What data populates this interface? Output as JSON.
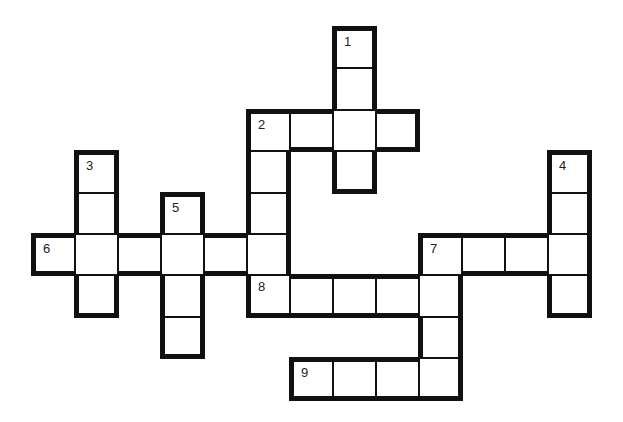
{
  "puzzle": {
    "type": "crossword",
    "grid": {
      "origin_x": 31,
      "origin_y": 26,
      "cell_w": 43,
      "cell_h": 41.4
    },
    "cells": [
      {
        "c": 7,
        "r": 0,
        "num": "1"
      },
      {
        "c": 7,
        "r": 1
      },
      {
        "c": 5,
        "r": 2,
        "num": "2"
      },
      {
        "c": 6,
        "r": 2
      },
      {
        "c": 7,
        "r": 2
      },
      {
        "c": 8,
        "r": 2
      },
      {
        "c": 7,
        "r": 3
      },
      {
        "c": 5,
        "r": 3
      },
      {
        "c": 5,
        "r": 4
      },
      {
        "c": 1,
        "r": 3,
        "num": "3"
      },
      {
        "c": 1,
        "r": 4
      },
      {
        "c": 1,
        "r": 6
      },
      {
        "c": 12,
        "r": 3,
        "num": "4"
      },
      {
        "c": 12,
        "r": 4
      },
      {
        "c": 12,
        "r": 6
      },
      {
        "c": 3,
        "r": 4,
        "num": "5"
      },
      {
        "c": 3,
        "r": 6
      },
      {
        "c": 3,
        "r": 7
      },
      {
        "c": 0,
        "r": 5,
        "num": "6"
      },
      {
        "c": 1,
        "r": 5
      },
      {
        "c": 2,
        "r": 5
      },
      {
        "c": 3,
        "r": 5
      },
      {
        "c": 4,
        "r": 5
      },
      {
        "c": 5,
        "r": 5
      },
      {
        "c": 9,
        "r": 5,
        "num": "7"
      },
      {
        "c": 10,
        "r": 5
      },
      {
        "c": 11,
        "r": 5
      },
      {
        "c": 12,
        "r": 5
      },
      {
        "c": 5,
        "r": 6,
        "num": "8"
      },
      {
        "c": 6,
        "r": 6
      },
      {
        "c": 7,
        "r": 6
      },
      {
        "c": 8,
        "r": 6
      },
      {
        "c": 9,
        "r": 6
      },
      {
        "c": 9,
        "r": 7
      },
      {
        "c": 6,
        "r": 8,
        "num": "9"
      },
      {
        "c": 7,
        "r": 8
      },
      {
        "c": 8,
        "r": 8
      },
      {
        "c": 9,
        "r": 8
      }
    ],
    "clues": {
      "across": [
        {
          "number": "2",
          "length": 4
        },
        {
          "number": "6",
          "length": 6
        },
        {
          "number": "7",
          "length": 4
        },
        {
          "number": "8",
          "length": 5
        },
        {
          "number": "9",
          "length": 4
        }
      ],
      "down": [
        {
          "number": "1",
          "length": 4
        },
        {
          "number": "2",
          "length": 4
        },
        {
          "number": "3",
          "length": 4
        },
        {
          "number": "4",
          "length": 4
        },
        {
          "number": "5",
          "length": 4
        },
        {
          "number": "7",
          "length": 4
        }
      ]
    },
    "colors": {
      "line": "#111111",
      "background": "#ffffff",
      "number": "#222222"
    }
  }
}
